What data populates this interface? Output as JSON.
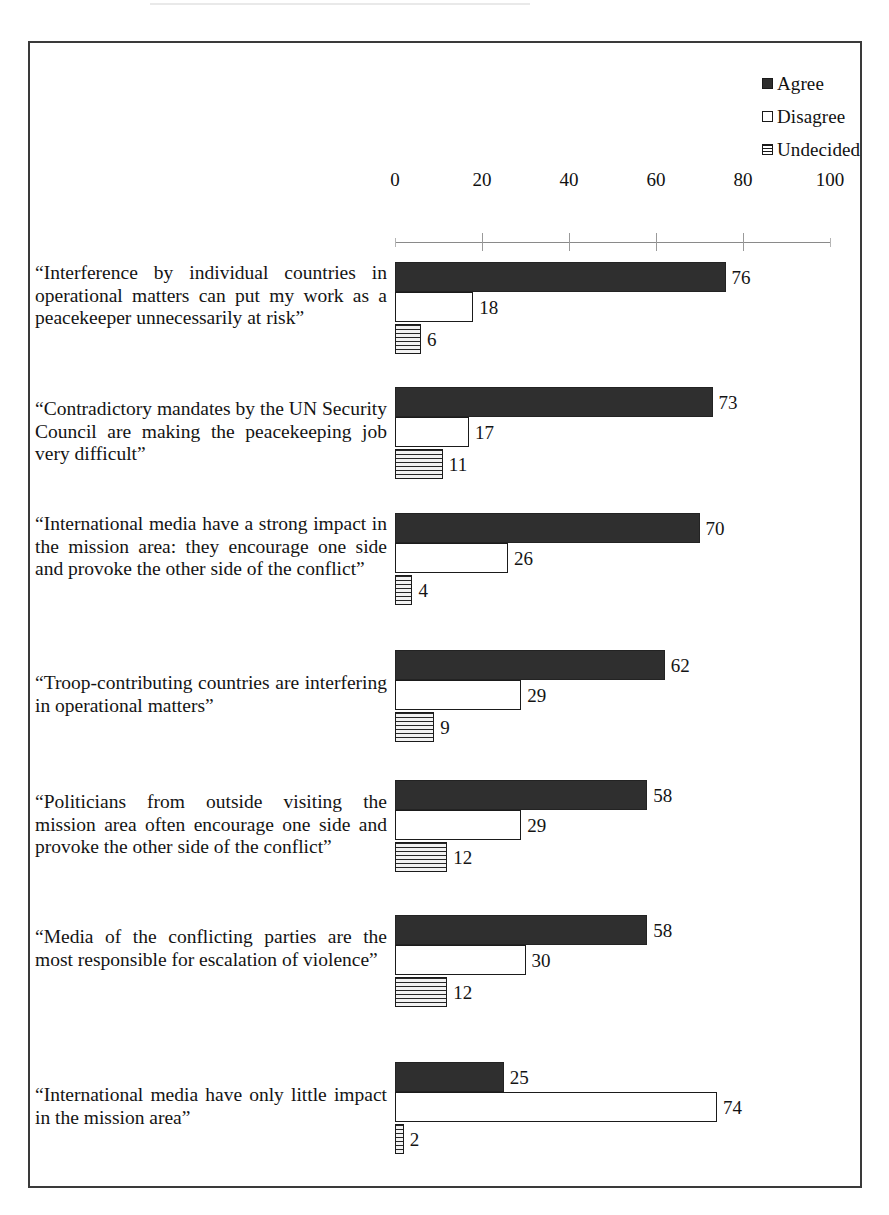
{
  "chart": {
    "type": "bar",
    "orientation": "horizontal-grouped",
    "title": "",
    "xlabel": "",
    "ylabel": "",
    "xlim": [
      0,
      100
    ],
    "xticks": [
      0,
      20,
      40,
      60,
      80,
      100
    ],
    "grid": false,
    "legend_position": "top-right"
  },
  "legend": {
    "items": [
      {
        "label": "Agree",
        "swatch": "solid-dark",
        "color": "#2f2f2f"
      },
      {
        "label": "Disagree",
        "swatch": "outline-white",
        "color": "#ffffff"
      },
      {
        "label": "Undecided",
        "swatch": "horizontal-stripes",
        "color": "#262626"
      }
    ]
  },
  "axis": {
    "ticks": [
      "0",
      "20",
      "40",
      "60",
      "80",
      "100"
    ]
  },
  "chart_data": {
    "type": "bar",
    "title": "",
    "xlabel": "",
    "ylabel": "",
    "xlim": [
      0,
      100
    ],
    "xticks": [
      0,
      20,
      40,
      60,
      80,
      100
    ],
    "grid": false,
    "legend_position": "top-right",
    "series": [
      {
        "name": "Agree",
        "values": [
          76,
          73,
          70,
          62,
          58,
          58,
          25
        ]
      },
      {
        "name": "Disagree",
        "values": [
          18,
          17,
          26,
          29,
          29,
          30,
          74
        ]
      },
      {
        "name": "Undecided",
        "values": [
          6,
          11,
          4,
          9,
          12,
          12,
          2
        ]
      }
    ],
    "categories": [
      "“Interference by individual countries in operational matters can put my work as a peacekeeper unnecessarily at risk”",
      "“Contradictory mandates by the UN Security Council are making the peacekeeping job very difficult”",
      "“International media have a strong impact in the mission area: they encourage one side and provoke the other side of the conflict”",
      "“Troop-contributing countries are interfering in operational matters”",
      "“Politicians from outside visiting the mission area often encourage one side and provoke the other side of the conflict”",
      "“Media of the conflicting parties are the most responsible for escalation of violence”",
      "“International media have only little impact in the mission area”"
    ]
  },
  "groups": [
    {
      "label": "“Interference by individual countries in operational matters can put my work as a peacekeeper unnecessarily at risk”",
      "agree": "76",
      "disagree": "18",
      "undecided": "6"
    },
    {
      "label": "“Contradictory mandates by the UN Security Council are making the peacekeeping job very difficult”",
      "agree": "73",
      "disagree": "17",
      "undecided": "11"
    },
    {
      "label": "“International media have a strong impact in the mission area: they encourage one side and provoke the other side of the conflict”",
      "agree": "70",
      "disagree": "26",
      "undecided": "4"
    },
    {
      "label": "“Troop-contributing countries are interfering in operational matters”",
      "agree": "62",
      "disagree": "29",
      "undecided": "9"
    },
    {
      "label": "“Politicians from outside visiting the mission area often encourage one side and provoke the other side of the conflict”",
      "agree": "58",
      "disagree": "29",
      "undecided": "12"
    },
    {
      "label": "“Media of the conflicting parties are the most responsible for escalation of violence”",
      "agree": "58",
      "disagree": "30",
      "undecided": "12"
    },
    {
      "label": "“International media have only little impact in the mission area”",
      "agree": "25",
      "disagree": "74",
      "undecided": "2"
    }
  ]
}
